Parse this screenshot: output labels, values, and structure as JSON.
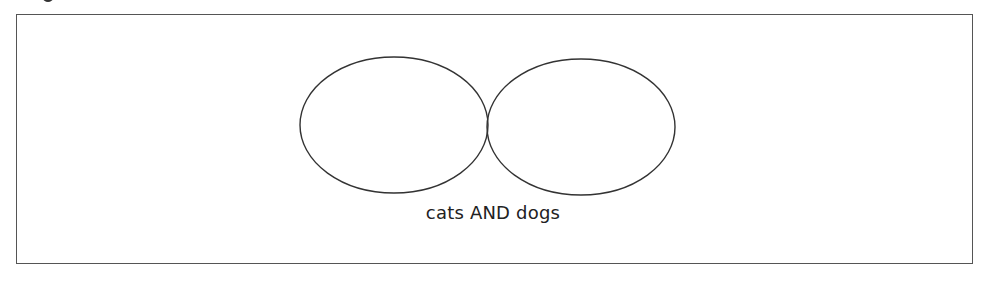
{
  "diagram": {
    "type": "venn",
    "sets": [
      {
        "name": "cats",
        "cx": 394,
        "cy": 125,
        "rx": 94,
        "ry": 68
      },
      {
        "name": "dogs",
        "cx": 581,
        "cy": 127,
        "rx": 94,
        "ry": 68
      }
    ],
    "highlighted_region": "intersection",
    "highlight_style": "diagonal-hatch",
    "label": "cats AND dogs",
    "colors": {
      "stroke": "#333333",
      "hatch": "#444444",
      "frame": "#555555",
      "background": "#ffffff"
    }
  }
}
